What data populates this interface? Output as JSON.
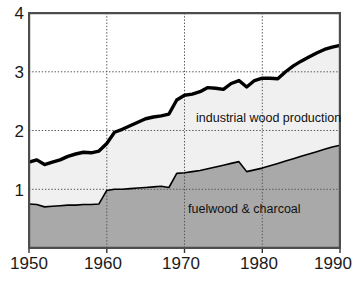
{
  "chart_data": {
    "type": "area",
    "title": "",
    "subtitle": "",
    "xlabel": "",
    "ylabel": "",
    "xlim": [
      1950,
      1990
    ],
    "ylim": [
      0,
      4
    ],
    "grid": true,
    "legend_position": "inline-annotations",
    "x_ticks": [
      "1950",
      "1960",
      "1970",
      "1980",
      "1990"
    ],
    "x_tick_values": [
      1950,
      1960,
      1970,
      1980,
      1990
    ],
    "y_ticks": [
      "1",
      "2",
      "3",
      "4"
    ],
    "y_tick_values": [
      1,
      2,
      3,
      4
    ],
    "x": [
      1950,
      1951,
      1952,
      1953,
      1954,
      1955,
      1956,
      1957,
      1958,
      1959,
      1960,
      1961,
      1962,
      1963,
      1964,
      1965,
      1966,
      1967,
      1968,
      1969,
      1970,
      1971,
      1972,
      1973,
      1974,
      1975,
      1976,
      1977,
      1978,
      1979,
      1980,
      1981,
      1982,
      1983,
      1984,
      1985,
      1986,
      1987,
      1988,
      1989,
      1990
    ],
    "series": [
      {
        "name": "fuelwood & charcoal",
        "label": "fuelwood & charcoal",
        "fill_color": "#a9a9a9",
        "stack_order": 1,
        "values": [
          0.75,
          0.74,
          0.7,
          0.71,
          0.72,
          0.73,
          0.73,
          0.74,
          0.74,
          0.75,
          0.98,
          1.0,
          1.0,
          1.01,
          1.02,
          1.03,
          1.04,
          1.05,
          1.03,
          1.27,
          1.28,
          1.3,
          1.32,
          1.35,
          1.38,
          1.41,
          1.44,
          1.47,
          1.3,
          1.33,
          1.36,
          1.4,
          1.44,
          1.48,
          1.52,
          1.56,
          1.6,
          1.64,
          1.68,
          1.72,
          1.75
        ]
      },
      {
        "name": "industrial wood production",
        "label": "industrial wood production",
        "fill_color": "#f0f0f0",
        "line_color": "#000000",
        "stack_order": 2,
        "values": [
          1.46,
          1.5,
          1.42,
          1.46,
          1.5,
          1.56,
          1.6,
          1.63,
          1.62,
          1.65,
          1.78,
          1.97,
          2.02,
          2.08,
          2.14,
          2.2,
          2.23,
          2.25,
          2.28,
          2.52,
          2.6,
          2.62,
          2.66,
          2.73,
          2.72,
          2.7,
          2.8,
          2.85,
          2.74,
          2.85,
          2.89,
          2.89,
          2.88,
          3.0,
          3.1,
          3.18,
          3.25,
          3.32,
          3.38,
          3.42,
          3.45
        ]
      }
    ],
    "annotations": [
      {
        "text": "industrial wood production",
        "x": 1972,
        "y": 2.2
      },
      {
        "text": "fuelwood & charcoal",
        "x": 1971,
        "y": 0.72
      }
    ]
  },
  "axes": {
    "y_tick_4": "4",
    "y_tick_3": "3",
    "y_tick_2": "2",
    "y_tick_1": "1",
    "x_tick_1950": "1950",
    "x_tick_1960": "1960",
    "x_tick_1970": "1970",
    "x_tick_1980": "1980",
    "x_tick_1990": "1990"
  },
  "labels": {
    "upper_band": "industrial wood production",
    "lower_band": "fuelwood & charcoal"
  },
  "colors": {
    "upper_fill": "#f0f0f0",
    "lower_fill": "#a9a9a9",
    "line": "#000000",
    "grid": "#555555",
    "frame": "#4d4d4d",
    "text": "#1a1a1a"
  }
}
